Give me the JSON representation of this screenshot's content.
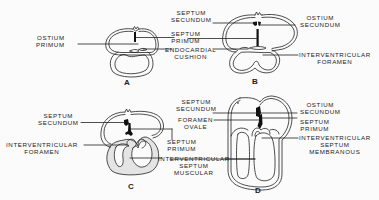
{
  "figure": {
    "panels": [
      {
        "id": "A",
        "letter": "A",
        "labels": {
          "ostium_primum": [
            "OSTIUM",
            "PRIMUM"
          ],
          "septum_primum": [
            "SEPTUM",
            "PRIMUM"
          ],
          "endocardial_cushion": [
            "ENDOCARDIAL",
            "CUSHION"
          ]
        }
      },
      {
        "id": "B",
        "letter": "B",
        "labels": {
          "septum_secundum": [
            "SEPTUM",
            "SECUNDUM"
          ],
          "ostium_secundum": [
            "OSTIUM",
            "SECUNDUM"
          ],
          "interventricular_foramen": [
            "INTERVENTRICULAR",
            "FORAMEN"
          ]
        }
      },
      {
        "id": "C",
        "letter": "C",
        "labels": {
          "septum_secundum": [
            "SEPTUM",
            "SECUNDUM"
          ],
          "interventricular_foramen": [
            "INTERVENTRICULAR",
            "FORAMEN"
          ],
          "septum_primum": [
            "SEPTUM",
            "PRIMUM"
          ],
          "interventricular_septum_muscular": [
            "INTERVENTRICULAR",
            "SEPTUM",
            "MUSCULAR"
          ]
        }
      },
      {
        "id": "D",
        "letter": "D",
        "labels": {
          "septum_secundum": [
            "SEPTUM",
            "SECUNDUM"
          ],
          "foramen_ovale": [
            "FORAMEN",
            "OVALE"
          ],
          "ostium_secundum": [
            "OSTIUM",
            "SECUNDUM"
          ],
          "septum_primum": [
            "SEPTUM",
            "PRIMUM"
          ],
          "interventricular_septum_membranous": [
            "INTERVENTRICULAR",
            "SEPTUM",
            "MEMBRANOUS"
          ]
        }
      }
    ],
    "colors": {
      "line": "#222222",
      "septum": "#111111",
      "ventricle_fill": "#e4e4e4",
      "background": "#fbfbfb"
    }
  }
}
